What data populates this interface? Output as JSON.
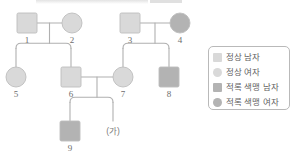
{
  "figure": {
    "type": "pedigree-chart",
    "colors": {
      "normal_fill": "#d9d9d9",
      "affected_fill": "#b3b3b3",
      "symbol_stroke": "#bdbdbd",
      "line": "#b0b0b0",
      "label_text": "#6d6d6d",
      "legend_border": "#b9b9b9",
      "legend_text": "#5f5f5f",
      "background": "#ffffff"
    }
  },
  "individuals": [
    {
      "id": "1",
      "label": "1",
      "sex": "male",
      "shape": "square",
      "status": "normal",
      "cx": 27,
      "cy": 23
    },
    {
      "id": "2",
      "label": "2",
      "sex": "female",
      "shape": "circle",
      "status": "normal",
      "cx": 72,
      "cy": 23
    },
    {
      "id": "3",
      "label": "3",
      "sex": "male",
      "shape": "square",
      "status": "normal",
      "cx": 130,
      "cy": 23
    },
    {
      "id": "4",
      "label": "4",
      "sex": "female",
      "shape": "circle",
      "status": "affected",
      "cx": 180,
      "cy": 23
    },
    {
      "id": "5",
      "label": "5",
      "sex": "female",
      "shape": "circle",
      "status": "normal",
      "cx": 16,
      "cy": 77
    },
    {
      "id": "6",
      "label": "6",
      "sex": "male",
      "shape": "square",
      "status": "normal",
      "cx": 71,
      "cy": 77
    },
    {
      "id": "7",
      "label": "7",
      "sex": "female",
      "shape": "circle",
      "status": "normal",
      "cx": 123,
      "cy": 77
    },
    {
      "id": "8",
      "label": "8",
      "sex": "male",
      "shape": "square",
      "status": "affected",
      "cx": 169,
      "cy": 77
    },
    {
      "id": "9",
      "label": "9",
      "sex": "male",
      "shape": "square",
      "status": "affected",
      "cx": 70,
      "cy": 131
    }
  ],
  "unknown_offspring": {
    "label": "(가)",
    "cx": 113,
    "cy": 131
  },
  "legend": {
    "items": [
      {
        "symbol": "square",
        "status": "normal",
        "label": "정상 남자"
      },
      {
        "symbol": "circle",
        "status": "normal",
        "label": "정상 여자"
      },
      {
        "symbol": "square",
        "status": "affected",
        "label": "적록 색맹 남자"
      },
      {
        "symbol": "circle",
        "status": "affected",
        "label": "적록 색맹 여자"
      }
    ]
  },
  "relationships": {
    "matings": [
      {
        "partners": [
          "1",
          "2"
        ],
        "children": [
          "5",
          "6"
        ]
      },
      {
        "partners": [
          "3",
          "4"
        ],
        "children": [
          "7",
          "8"
        ]
      },
      {
        "partners": [
          "6",
          "7"
        ],
        "children": [
          "9",
          "(가)"
        ]
      }
    ]
  }
}
